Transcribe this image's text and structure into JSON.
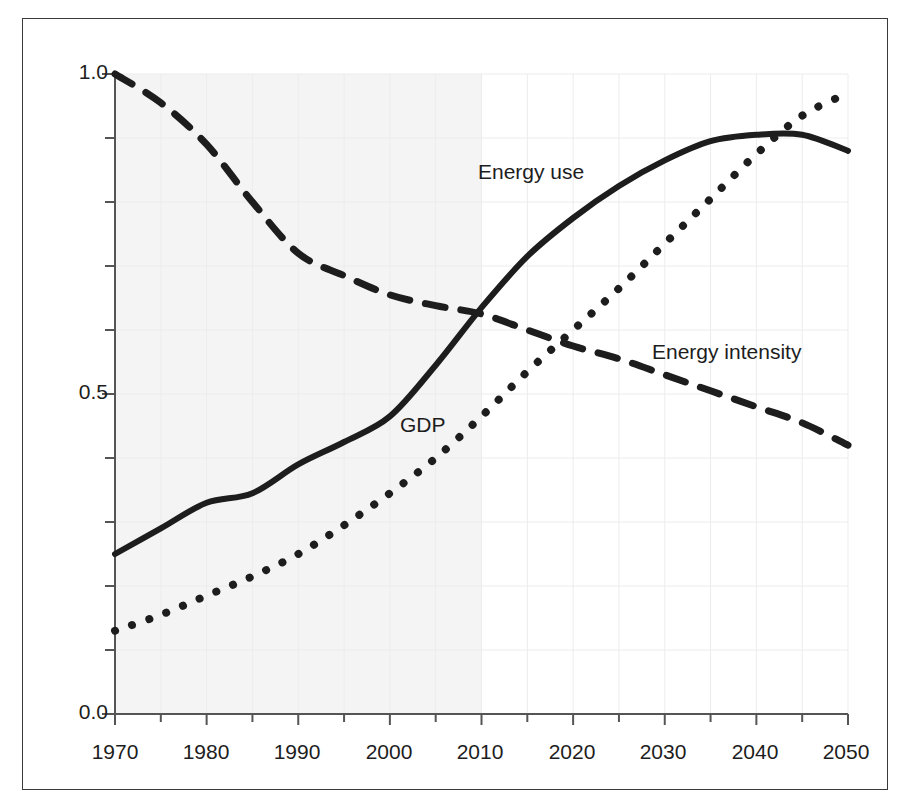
{
  "chart_data": {
    "type": "line",
    "title": "",
    "subtitle": "",
    "xlabel": "",
    "ylabel": "",
    "xlim": [
      1970,
      2050
    ],
    "ylim": [
      0.0,
      1.0
    ],
    "grid": true,
    "legend_position": "inline-annotations",
    "x_ticks_major": [
      1970,
      1980,
      1990,
      2000,
      2010,
      2020,
      2030,
      2040,
      2050
    ],
    "x_tick_labels": [
      "1970",
      "1980",
      "1990",
      "2000",
      "2010",
      "2020",
      "2030",
      "2040",
      "2050"
    ],
    "x_tick_minor_step": 5,
    "y_ticks_major": [
      0.0,
      0.5,
      1.0
    ],
    "y_tick_labels": [
      "0.0",
      "0.5",
      "1.0"
    ],
    "y_tick_minor_step": 0.1,
    "shaded_region": {
      "label": "",
      "x_start": 1970,
      "x_end": 2010,
      "color": "#f4f4f4"
    },
    "x": [
      1970,
      1975,
      1980,
      1985,
      1990,
      1995,
      2000,
      2005,
      2010,
      2015,
      2020,
      2025,
      2030,
      2035,
      2040,
      2045,
      2050
    ],
    "series": [
      {
        "name": "Energy use",
        "style": "solid",
        "color": "#1d1d1d",
        "label_x": 2012,
        "label_y": 0.8,
        "values": [
          0.25,
          0.29,
          0.33,
          0.345,
          0.39,
          0.425,
          0.465,
          0.545,
          0.635,
          0.715,
          0.775,
          0.825,
          0.865,
          0.895,
          0.905,
          0.905,
          0.88
        ]
      },
      {
        "name": "GDP",
        "style": "dotted",
        "color": "#1d1d1d",
        "label_x": 2002,
        "label_y": 0.455,
        "values": [
          0.13,
          0.155,
          0.185,
          0.215,
          0.25,
          0.295,
          0.345,
          0.4,
          0.465,
          0.535,
          0.6,
          0.665,
          0.735,
          0.805,
          0.875,
          0.935,
          0.97
        ]
      },
      {
        "name": "Energy intensity",
        "style": "dashed",
        "color": "#1d1d1d",
        "label_x": 2023,
        "label_y": 0.585,
        "values": [
          1.0,
          0.955,
          0.89,
          0.8,
          0.72,
          0.685,
          0.655,
          0.638,
          0.625,
          0.6,
          0.575,
          0.555,
          0.53,
          0.505,
          0.48,
          0.455,
          0.42
        ]
      }
    ]
  },
  "axes": {
    "y_labels": [
      "1.0",
      "0.5",
      "0.0"
    ],
    "x_labels": [
      "1970",
      "1980",
      "1990",
      "2000",
      "2010",
      "2020",
      "2030",
      "2040",
      "2050"
    ]
  },
  "annotations": {
    "energy_use": "Energy use",
    "gdp": "GDP",
    "energy_intensity": "Energy intensity"
  },
  "colors": {
    "line": "#1d1d1d",
    "axis": "#555555",
    "grid": "#ececec",
    "shade": "#f4f4f4",
    "frame": "#3a3a3a",
    "background": "#ffffff"
  }
}
